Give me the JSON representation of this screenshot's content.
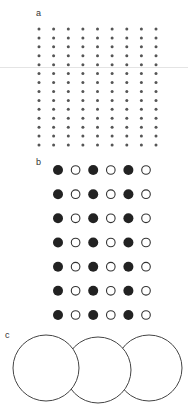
{
  "panels": {
    "a": {
      "label": "a",
      "rows": 14,
      "cols": 9,
      "dot_color": "#555555"
    },
    "b": {
      "label": "b",
      "rows": 7,
      "cols": 6,
      "pattern": [
        "filled",
        "hollow",
        "filled",
        "hollow",
        "filled",
        "hollow"
      ],
      "filled_color": "#222222",
      "stroke_color": "#333333"
    },
    "c": {
      "label": "c",
      "circles": 3,
      "stroke_color": "#444444"
    }
  }
}
